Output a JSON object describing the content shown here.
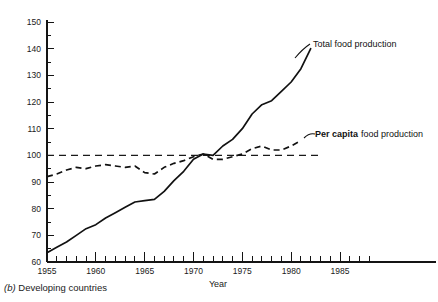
{
  "caption": {
    "marker": "(b)",
    "text": "Developing countries"
  },
  "chart_data": {
    "type": "line",
    "title": "",
    "xlabel": "Year",
    "ylabel": "",
    "xlim": [
      1955,
      1988
    ],
    "ylim": [
      60,
      150
    ],
    "grid": false,
    "legend_position": "inline-annotation",
    "xticks": [
      1955,
      1960,
      1965,
      1970,
      1975,
      1980,
      1985
    ],
    "xtick_labels": [
      "1955",
      "1960",
      "1965",
      "1970",
      "1975",
      "1980",
      "1985"
    ],
    "xtick_minor_step": 1,
    "yticks": [
      60,
      70,
      80,
      90,
      100,
      110,
      120,
      130,
      140,
      150
    ],
    "ytick_labels": [
      "60",
      "70",
      "80",
      "90",
      "100",
      "110",
      "120",
      "130",
      "140",
      "150"
    ],
    "reference_line": {
      "label": "index 100",
      "value": 100,
      "style": "dashed",
      "x_from": 1955,
      "x_to": 1983
    },
    "annotations": [
      {
        "id": "total-food-production",
        "text": "Total food production",
        "bold_prefix": "",
        "x": 1984.5,
        "y": 141
      },
      {
        "id": "per-capita-food-production",
        "text": "food production",
        "bold_prefix": "Per capita",
        "x": 1983,
        "y": 108
      }
    ],
    "series": [
      {
        "name": "Total food production",
        "style": "solid",
        "x": [
          1955,
          1956,
          1957,
          1958,
          1959,
          1960,
          1961,
          1962,
          1963,
          1964,
          1965,
          1966,
          1967,
          1968,
          1969,
          1970,
          1971,
          1972,
          1973,
          1974,
          1975,
          1976,
          1977,
          1978,
          1979,
          1980,
          1981,
          1982
        ],
        "values": [
          63.5,
          65.5,
          67.5,
          70.0,
          72.5,
          74.0,
          76.5,
          78.5,
          80.5,
          82.5,
          83.0,
          83.5,
          86.5,
          90.5,
          94.0,
          98.5,
          100.5,
          100.0,
          103.5,
          106.0,
          110.0,
          115.5,
          119.0,
          120.5,
          124.0,
          127.5,
          132.5,
          140.0
        ]
      },
      {
        "name": "Per capita food production",
        "style": "dashed",
        "x": [
          1955,
          1956,
          1957,
          1958,
          1959,
          1960,
          1961,
          1962,
          1963,
          1964,
          1965,
          1966,
          1967,
          1968,
          1969,
          1970,
          1971,
          1972,
          1973,
          1974,
          1975,
          1976,
          1977,
          1978,
          1979,
          1980,
          1981
        ],
        "values": [
          92.0,
          93.0,
          94.5,
          95.5,
          95.0,
          96.0,
          96.5,
          96.0,
          95.5,
          96.0,
          93.5,
          93.0,
          95.5,
          97.0,
          98.0,
          99.5,
          100.5,
          98.5,
          98.5,
          99.5,
          100.5,
          102.5,
          103.5,
          102.0,
          102.0,
          103.5,
          105.5
        ]
      }
    ]
  }
}
